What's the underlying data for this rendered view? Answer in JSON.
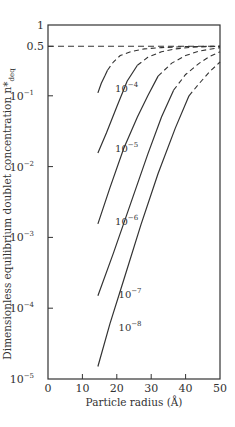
{
  "chart_data": {
    "type": "line",
    "title": "",
    "xlabel": "Particle radius (Å)",
    "ylabel": "Dimensionless equilibrium doublet concentration n*",
    "ylabel_subscript": "deq",
    "xlim": [
      0,
      50
    ],
    "ylim": [
      1e-05,
      1
    ],
    "yscale": "log",
    "grid": false,
    "legend": "none",
    "x_ticks": [
      {
        "value": 0,
        "label": "0"
      },
      {
        "value": 10,
        "label": "10"
      },
      {
        "value": 20,
        "label": "20"
      },
      {
        "value": 30,
        "label": "30"
      },
      {
        "value": 40,
        "label": "40"
      },
      {
        "value": 50,
        "label": "50"
      }
    ],
    "y_ticks": [
      {
        "value": 1,
        "base": "1",
        "exp": ""
      },
      {
        "value": 0.5,
        "base": "0.5",
        "exp": ""
      },
      {
        "value": 0.1,
        "base": "10",
        "exp": "−1"
      },
      {
        "value": 0.01,
        "base": "10",
        "exp": "−2"
      },
      {
        "value": 0.001,
        "base": "10",
        "exp": "−3"
      },
      {
        "value": 0.0001,
        "base": "10",
        "exp": "−4"
      },
      {
        "value": 1e-05,
        "base": "10",
        "exp": "−5"
      }
    ],
    "reference_line": {
      "y": 0.5,
      "style": "dashed"
    },
    "series": [
      {
        "name": "10^-4",
        "label_base": "10",
        "label_exp": "−4",
        "label_at": {
          "x": 19.5,
          "y": 0.13
        },
        "solid": {
          "x": [
            14.5,
            15.5,
            16.5,
            17.3
          ],
          "y": [
            0.11,
            0.15,
            0.19,
            0.23
          ]
        },
        "dashed": {
          "x": [
            17.3,
            19,
            21,
            24,
            28,
            33,
            40,
            50
          ],
          "y": [
            0.23,
            0.3,
            0.37,
            0.42,
            0.46,
            0.48,
            0.495,
            0.5
          ]
        }
      },
      {
        "name": "10^-5",
        "label_base": "10",
        "label_exp": "−5",
        "label_at": {
          "x": 19.5,
          "y": 0.0185
        },
        "solid": {
          "x": [
            14.5,
            17,
            20,
            23,
            26
          ],
          "y": [
            0.0155,
            0.03,
            0.07,
            0.16,
            0.27
          ]
        },
        "dashed": {
          "x": [
            26,
            29,
            33,
            37,
            42,
            50
          ],
          "y": [
            0.27,
            0.35,
            0.42,
            0.46,
            0.485,
            0.5
          ]
        }
      },
      {
        "name": "10^-6",
        "label_base": "10",
        "label_exp": "−6",
        "label_at": {
          "x": 19.5,
          "y": 0.0017
        },
        "solid": {
          "x": [
            14.5,
            18,
            22,
            26,
            29,
            32
          ],
          "y": [
            0.00155,
            0.005,
            0.018,
            0.05,
            0.1,
            0.19
          ]
        },
        "dashed": {
          "x": [
            32,
            36,
            40,
            44,
            50
          ],
          "y": [
            0.19,
            0.29,
            0.37,
            0.43,
            0.48
          ]
        }
      },
      {
        "name": "10^-7",
        "label_base": "10",
        "label_exp": "−7",
        "label_at": {
          "x": 20.5,
          "y": 0.00016
        },
        "solid": {
          "x": [
            14.5,
            19,
            24,
            29,
            33,
            36.5
          ],
          "y": [
            0.00015,
            0.0006,
            0.003,
            0.015,
            0.05,
            0.12
          ]
        },
        "dashed": {
          "x": [
            36.5,
            40,
            44,
            47,
            50
          ],
          "y": [
            0.12,
            0.2,
            0.29,
            0.36,
            0.42
          ]
        }
      },
      {
        "name": "10^-8",
        "label_base": "10",
        "label_exp": "−8",
        "label_at": {
          "x": 20.5,
          "y": 5.5e-05
        },
        "solid": {
          "x": [
            14.5,
            18,
            22,
            27,
            32,
            37,
            41
          ],
          "y": [
            1.5e-05,
            6e-05,
            0.00025,
            0.0015,
            0.008,
            0.035,
            0.1
          ]
        },
        "dashed": {
          "x": [
            41,
            44,
            47,
            50
          ],
          "y": [
            0.1,
            0.15,
            0.22,
            0.3
          ]
        }
      }
    ]
  }
}
